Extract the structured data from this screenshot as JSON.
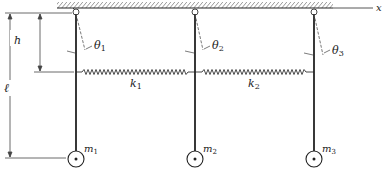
{
  "figure": {
    "axis_label": "x",
    "dimensions": {
      "h_label": "h",
      "l_label": "ℓ"
    },
    "pendulums": [
      {
        "angle_label": "θ",
        "angle_sub": "1",
        "mass_label": "m",
        "mass_sub": "1"
      },
      {
        "angle_label": "θ",
        "angle_sub": "2",
        "mass_label": "m",
        "mass_sub": "2"
      },
      {
        "angle_label": "θ",
        "angle_sub": "3",
        "mass_label": "m",
        "mass_sub": "3"
      }
    ],
    "springs": [
      {
        "label": "k",
        "sub": "1"
      },
      {
        "label": "k",
        "sub": "2"
      }
    ],
    "colors": {
      "ink": "#222222",
      "background": "#ffffff"
    }
  }
}
